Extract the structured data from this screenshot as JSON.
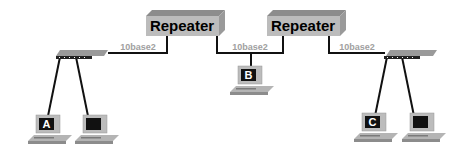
{
  "diagram": {
    "repeaters": [
      {
        "label": "Repeater"
      },
      {
        "label": "Repeater"
      }
    ],
    "segments": [
      {
        "label": "10base2"
      },
      {
        "label": "10base2"
      },
      {
        "label": "10base2"
      }
    ],
    "computers": [
      {
        "label": "A"
      },
      {
        "label": ""
      },
      {
        "label": "B"
      },
      {
        "label": "C"
      },
      {
        "label": ""
      }
    ],
    "colors": {
      "device_gray": "#b4b4b4",
      "device_top": "#8c8c8c",
      "cable": "#111111",
      "segment_label": "#a0a0a0",
      "screen": "#111111"
    }
  }
}
